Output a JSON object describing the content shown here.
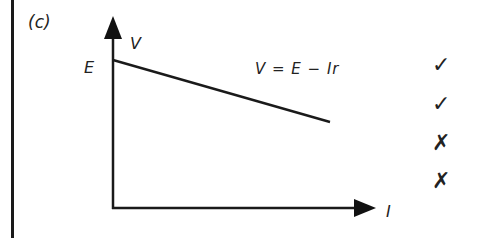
{
  "part_label": "(c)",
  "graph": {
    "y_axis_label": "V",
    "x_axis_label": "I",
    "intercept_label": "E",
    "equation": "V = E − Ir",
    "line": {
      "x0": 113,
      "y0": 60,
      "x1": 330,
      "y1": 122
    },
    "line_color": "#1a1a1a"
  },
  "chart_data": {
    "type": "line",
    "title": "",
    "xlabel": "I",
    "ylabel": "V",
    "series": [
      {
        "name": "V = E − Ir",
        "x": [
          0,
          1
        ],
        "y": [
          "E",
          "E − Ir"
        ]
      }
    ],
    "annotations": [
      "E (y-intercept)",
      "V = E − Ir"
    ],
    "grid": false
  },
  "marks": [
    {
      "symbol": "✓",
      "meaning": "tick"
    },
    {
      "symbol": "✓",
      "meaning": "tick"
    },
    {
      "symbol": "✗",
      "meaning": "cross"
    },
    {
      "symbol": "✗",
      "meaning": "cross"
    }
  ]
}
